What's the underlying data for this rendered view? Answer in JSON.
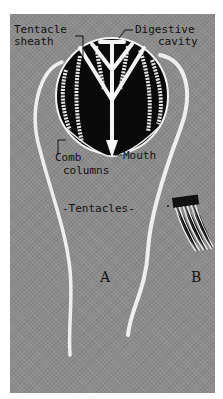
{
  "figure": {
    "background_color": "#8c8c8c",
    "body_color": "#0a0a0a",
    "structure_color": "#f2f2f2",
    "labels": {
      "tentacle_sheath_1": "Tentacle",
      "tentacle_sheath_2": "sheath",
      "digestive_cavity_1": "Digestive",
      "digestive_cavity_2": "cavity",
      "comb_columns_1": "Comb",
      "comb_columns_2": "columns",
      "mouth": "Mouth",
      "tentacles": "-Tentacles-",
      "panel_a": "A",
      "panel_b": "B"
    },
    "parts": [
      "tentacle-sheath",
      "digestive-cavity",
      "comb-columns",
      "mouth",
      "tentacles",
      "comb-plate-detail"
    ]
  }
}
